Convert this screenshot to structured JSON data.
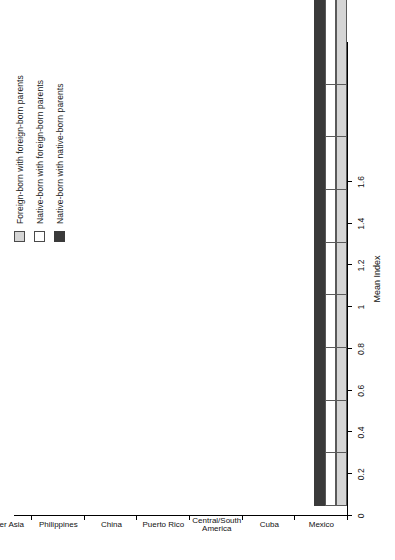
{
  "chart_data": {
    "type": "bar",
    "title": "",
    "orientation": "vertical-groups-rotated",
    "xlabel": "",
    "ylabel": "Mean Index",
    "ylim": [
      0,
      1.6
    ],
    "ytick_step": 0.2,
    "yticks": [
      "0",
      "0.2",
      "0.4",
      "0.6",
      "0.8",
      "1",
      "1.2",
      "1.4",
      "1.6"
    ],
    "grid": false,
    "legend_position": "top-left",
    "categories": [
      "Mexico",
      "Cuba",
      "Central/South America",
      "Puerto Rico",
      "China",
      "Philippines",
      "Other Asia",
      "Africa/Afro-Caribbean",
      "Europe/Canada"
    ],
    "category_lines": [
      [
        "Mexico"
      ],
      [
        "Cuba"
      ],
      [
        "Central/South",
        "America"
      ],
      [
        "Puerto Rico"
      ],
      [
        "China"
      ],
      [
        "Philippines"
      ],
      [
        "Other Asia"
      ],
      [
        "Africa/Afro-",
        "Caribbean"
      ],
      [
        "Europe/Canada"
      ]
    ],
    "series": [
      {
        "name": "Foreign-born with foreign-born parents",
        "color": "#d5d5d5",
        "values": [
          0.8,
          0.6,
          0.82,
          1.1,
          0.38,
          0.68,
          0.62,
          0.6,
          0.6
        ]
      },
      {
        "name": "Native-born with foreign-born parents",
        "color": "#ffffff",
        "values": [
          1.12,
          1.05,
          1.02,
          1.4,
          0.62,
          0.95,
          0.98,
          1.03,
          0.88
        ]
      },
      {
        "name": "Native-born with native-born parents",
        "color": "#3a3a3a",
        "values": [
          1.22,
          1.13,
          1.13,
          1.22,
          0.9,
          1.25,
          1.05,
          1.12,
          1.03
        ]
      }
    ]
  },
  "legend": {
    "items": [
      {
        "label": "Foreign-born with foreign-born parents",
        "swatch": "gray"
      },
      {
        "label": "Native-born with foreign-born parents",
        "swatch": "white"
      },
      {
        "label": "Native-born with native-born parents",
        "swatch": "dark"
      }
    ]
  },
  "axis": {
    "value_axis_title": "Mean Index"
  }
}
